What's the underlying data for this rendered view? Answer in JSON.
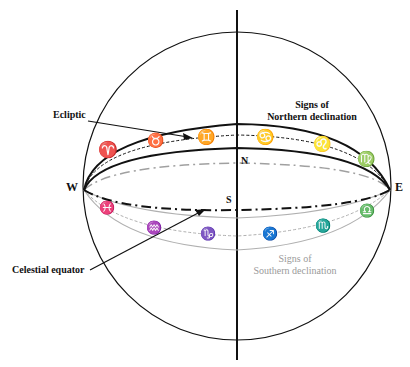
{
  "diagram": {
    "type": "celestial sphere",
    "labels": {
      "ecliptic": "Ecliptic",
      "celestial_equator": "Celestial equator",
      "northern_line1": "Signs of",
      "northern_line2": "Northern declination",
      "southern_line1": "Signs of",
      "southern_line2": "Southern declination",
      "west": "W",
      "east": "E",
      "north": "N",
      "south": "S"
    },
    "northern_signs": [
      {
        "name": "Aries",
        "glyph": "♈"
      },
      {
        "name": "Taurus",
        "glyph": "♉"
      },
      {
        "name": "Gemini",
        "glyph": "♊"
      },
      {
        "name": "Cancer",
        "glyph": "♋"
      },
      {
        "name": "Leo",
        "glyph": "♌"
      },
      {
        "name": "Virgo",
        "glyph": "♍"
      }
    ],
    "southern_signs": [
      {
        "name": "Pisces",
        "glyph": "♓"
      },
      {
        "name": "Aquarius",
        "glyph": "♒"
      },
      {
        "name": "Capricorn",
        "glyph": "♑"
      },
      {
        "name": "Sagittarius",
        "glyph": "♐"
      },
      {
        "name": "Scorpio",
        "glyph": "♏"
      },
      {
        "name": "Libra",
        "glyph": "♎"
      }
    ],
    "colors": {
      "line": "#111111",
      "faded": "#a8a8a8"
    }
  }
}
